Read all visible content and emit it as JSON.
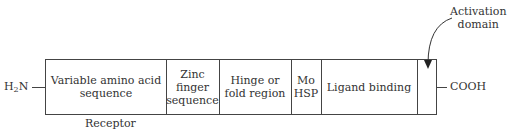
{
  "n_terminus": {
    "prefix": "H",
    "sub": "2",
    "suffix": "N"
  },
  "c_terminus": "COOH",
  "segments": [
    {
      "label": "Variable amino acid sequence",
      "lines": [
        "Variable amino acid",
        "sequence"
      ]
    },
    {
      "label": "Zinc finger sequence",
      "lines": [
        "Zinc",
        "finger",
        "sequence"
      ]
    },
    {
      "label": "Hinge or fold region",
      "lines": [
        "Hinge or",
        "fold region"
      ]
    },
    {
      "label": "Mo HSP",
      "lines": [
        "Mo",
        "HSP"
      ]
    },
    {
      "label": "Ligand binding",
      "lines": [
        "Ligand binding"
      ]
    },
    {
      "label": "",
      "lines": []
    }
  ],
  "caption": "Receptor",
  "annotation": {
    "lines": [
      "Activation",
      "domain"
    ]
  }
}
